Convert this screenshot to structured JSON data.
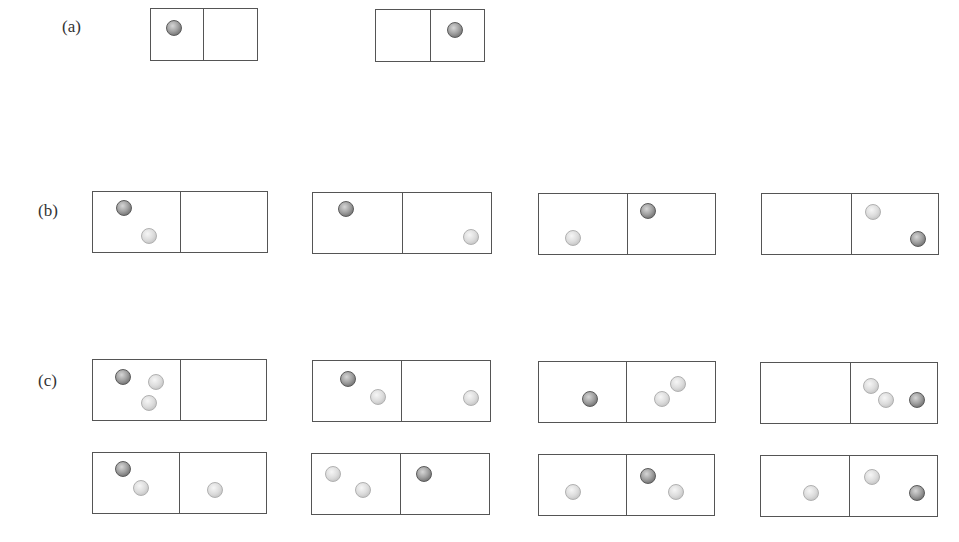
{
  "labels": {
    "a": "(a)",
    "b": "(b)",
    "c": "(c)"
  },
  "colors": {
    "distinguishable_particle": "#7a7a7a",
    "identical_particle": "#d8d8d8",
    "box_border": "#555555"
  },
  "rows": [
    {
      "label": "(a)",
      "label_pos": [
        62,
        27
      ],
      "boxes": [
        {
          "x": 150,
          "y": 8,
          "w": 108,
          "h": 53,
          "divider": 53,
          "balls": [
            {
              "type": "dark",
              "cx": 174,
              "cy": 28
            }
          ]
        },
        {
          "x": 375,
          "y": 9,
          "w": 110,
          "h": 53,
          "divider": 55,
          "balls": [
            {
              "type": "dark",
              "cx": 455,
              "cy": 30
            }
          ]
        }
      ]
    },
    {
      "label": "(b)",
      "label_pos": [
        38,
        211
      ],
      "boxes": [
        {
          "x": 92,
          "y": 191,
          "w": 176,
          "h": 62,
          "divider": 88,
          "balls": [
            {
              "type": "dark",
              "cx": 124,
              "cy": 208
            },
            {
              "type": "light",
              "cx": 149,
              "cy": 236
            }
          ]
        },
        {
          "x": 312,
          "y": 192,
          "w": 180,
          "h": 62,
          "divider": 90,
          "balls": [
            {
              "type": "dark",
              "cx": 346,
              "cy": 209
            },
            {
              "type": "light",
              "cx": 471,
              "cy": 237
            }
          ]
        },
        {
          "x": 538,
          "y": 193,
          "w": 178,
          "h": 62,
          "divider": 89,
          "balls": [
            {
              "type": "light",
              "cx": 573,
              "cy": 238
            },
            {
              "type": "dark",
              "cx": 648,
              "cy": 211
            }
          ]
        },
        {
          "x": 761,
          "y": 193,
          "w": 178,
          "h": 62,
          "divider": 90,
          "balls": [
            {
              "type": "light",
              "cx": 873,
              "cy": 212
            },
            {
              "type": "dark",
              "cx": 918,
              "cy": 239
            }
          ]
        }
      ]
    },
    {
      "label": "(c)",
      "label_pos": [
        38,
        381
      ],
      "boxes": [
        {
          "x": 92,
          "y": 359,
          "w": 175,
          "h": 62,
          "divider": 88,
          "balls": [
            {
              "type": "dark",
              "cx": 123,
              "cy": 377
            },
            {
              "type": "light",
              "cx": 156,
              "cy": 382
            },
            {
              "type": "light",
              "cx": 149,
              "cy": 403
            }
          ]
        },
        {
          "x": 312,
          "y": 360,
          "w": 179,
          "h": 62,
          "divider": 89,
          "balls": [
            {
              "type": "dark",
              "cx": 348,
              "cy": 379
            },
            {
              "type": "light",
              "cx": 378,
              "cy": 397
            },
            {
              "type": "light",
              "cx": 471,
              "cy": 398
            }
          ]
        },
        {
          "x": 538,
          "y": 361,
          "w": 178,
          "h": 62,
          "divider": 88,
          "balls": [
            {
              "type": "dark",
              "cx": 590,
              "cy": 399
            },
            {
              "type": "light",
              "cx": 678,
              "cy": 384
            },
            {
              "type": "light",
              "cx": 662,
              "cy": 399
            }
          ]
        },
        {
          "x": 760,
          "y": 362,
          "w": 178,
          "h": 62,
          "divider": 90,
          "balls": [
            {
              "type": "light",
              "cx": 871,
              "cy": 386
            },
            {
              "type": "light",
              "cx": 886,
              "cy": 400
            },
            {
              "type": "dark",
              "cx": 917,
              "cy": 400
            }
          ]
        }
      ]
    },
    {
      "label": "",
      "label_pos": [
        0,
        0
      ],
      "boxes": [
        {
          "x": 92,
          "y": 452,
          "w": 175,
          "h": 62,
          "divider": 87,
          "balls": [
            {
              "type": "dark",
              "cx": 123,
              "cy": 469
            },
            {
              "type": "light",
              "cx": 141,
              "cy": 488
            },
            {
              "type": "light",
              "cx": 215,
              "cy": 490
            }
          ]
        },
        {
          "x": 311,
          "y": 453,
          "w": 179,
          "h": 62,
          "divider": 89,
          "balls": [
            {
              "type": "light",
              "cx": 333,
              "cy": 474
            },
            {
              "type": "light",
              "cx": 363,
              "cy": 490
            },
            {
              "type": "dark",
              "cx": 424,
              "cy": 474
            }
          ]
        },
        {
          "x": 538,
          "y": 454,
          "w": 177,
          "h": 62,
          "divider": 88,
          "balls": [
            {
              "type": "light",
              "cx": 573,
              "cy": 492
            },
            {
              "type": "dark",
              "cx": 648,
              "cy": 476
            },
            {
              "type": "light",
              "cx": 676,
              "cy": 492
            }
          ]
        },
        {
          "x": 760,
          "y": 455,
          "w": 178,
          "h": 62,
          "divider": 89,
          "balls": [
            {
              "type": "light",
              "cx": 811,
              "cy": 493
            },
            {
              "type": "light",
              "cx": 872,
              "cy": 477
            },
            {
              "type": "dark",
              "cx": 917,
              "cy": 493
            }
          ]
        }
      ]
    }
  ]
}
